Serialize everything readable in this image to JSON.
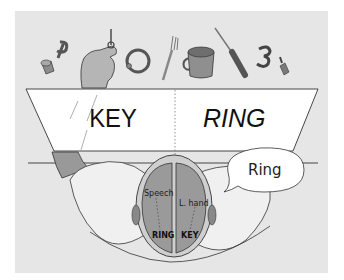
{
  "figure": {
    "screen": {
      "left_word": "KEY",
      "separator": "·",
      "right_word": "RING"
    },
    "speech_bubble": "Ring",
    "brain_labels": {
      "left_hemisphere_function": "Speech",
      "right_hemisphere_function": "L. hand",
      "left_hemisphere_word": "RING",
      "right_hemisphere_word": "KEY"
    },
    "objects_on_table": [
      "thimble-icon",
      "letter-p-icon",
      "key-icon",
      "ring-icon",
      "fork-icon",
      "cup-icon",
      "screwdriver-icon",
      "number-3-icon",
      "bottle-icon"
    ],
    "colors": {
      "background": "#ffffff",
      "panel": "#e6e6e6",
      "screen": "#ffffff",
      "brain": "#9a9a9a",
      "outline": "#222222"
    }
  }
}
